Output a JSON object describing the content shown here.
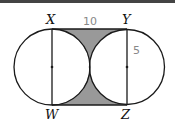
{
  "diagram": {
    "type": "geometry-figure",
    "points": {
      "X": "X",
      "Y": "Y",
      "W": "W",
      "Z": "Z"
    },
    "measurements": {
      "top_side": "10",
      "radius_label": "5"
    },
    "colors": {
      "stroke": "#1a1a1a",
      "shaded": "#999999",
      "label": "#111111",
      "measure": "#888888",
      "border": "#444444"
    }
  }
}
